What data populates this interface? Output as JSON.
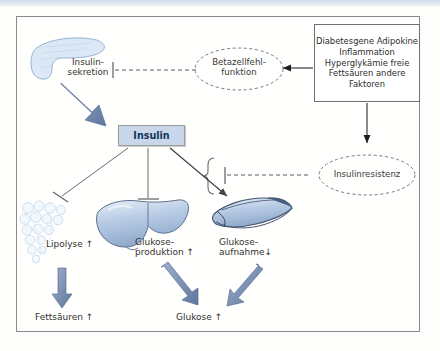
{
  "figure": {
    "language": "de",
    "border_color": "#8a8a8a",
    "background": "#fffffe",
    "accent_blue": "#6c85ad",
    "organ_blue": "#a8bedd",
    "insulin_box_fill": "#c8d8ea",
    "insulin_text_color": "#16355e"
  },
  "nodes": {
    "pancreas": {
      "name": "pancreas-organ",
      "label": ""
    },
    "insulin_secretion": {
      "label": "Insulin-\nsekretion"
    },
    "beta_cell": {
      "label": "Betazellfehl-\nfunktion"
    },
    "factors": {
      "lines": [
        "Diabetesgene",
        "Adipokine",
        "Inflammation",
        "Hyperglykämie",
        "freie Fettsäuren",
        "andere Faktoren"
      ],
      "text": "Diabetesgene\nAdipokine\nInflammation\nHyperglykämie\nfreie Fettsäuren\nandere Faktoren"
    },
    "insulin": {
      "label": "Insulin"
    },
    "insulin_resistance": {
      "label": "Insulinresistenz"
    },
    "adipose": {
      "label": "Lipolyse ↑"
    },
    "liver": {
      "label": "Glukose-\nproduktion ↑"
    },
    "muscle": {
      "label": "Glukose-\naufnahme↓"
    },
    "fatty_acids": {
      "label": "Fettsäuren ↑"
    },
    "glucose": {
      "label": "Glukose ↑"
    }
  },
  "edges": [
    {
      "from": "factors",
      "to": "beta_cell",
      "style": "solid-arrow"
    },
    {
      "from": "factors",
      "to": "insulin_resistance",
      "style": "solid-arrow"
    },
    {
      "from": "beta_cell",
      "to": "insulin_secretion",
      "style": "dashed-inhibit"
    },
    {
      "from": "insulin_secretion",
      "to": "insulin",
      "style": "thick-blue-arrow"
    },
    {
      "from": "insulin",
      "to": "adipose",
      "style": "inhibit"
    },
    {
      "from": "insulin",
      "to": "liver",
      "style": "inhibit"
    },
    {
      "from": "insulin",
      "to": "muscle",
      "style": "arrow"
    },
    {
      "from": "insulin_resistance",
      "to": "insulin-effects-brace",
      "style": "dashed-inhibit"
    },
    {
      "from": "adipose",
      "to": "fatty_acids",
      "style": "thick-blue-arrow"
    },
    {
      "from": "liver",
      "to": "glucose",
      "style": "thick-blue-arrow"
    },
    {
      "from": "muscle",
      "to": "glucose",
      "style": "thick-blue-arrow"
    }
  ]
}
